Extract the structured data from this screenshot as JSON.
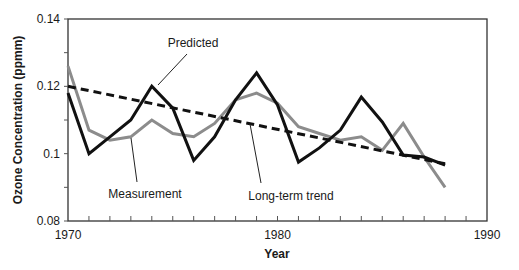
{
  "chart_data": {
    "type": "line",
    "title": "",
    "xlabel": "Year",
    "ylabel": "Ozone Concentration (ppmm)",
    "xlim": [
      1970,
      1990
    ],
    "ylim": [
      0.08,
      0.14
    ],
    "x_ticks": [
      1970,
      1980,
      1990
    ],
    "x_tick_labels": [
      "1970",
      "1980",
      "1990"
    ],
    "x_minor_step": 1,
    "y_ticks": [
      0.08,
      0.1,
      0.12,
      0.14
    ],
    "y_tick_labels": [
      "0.08",
      "0.1",
      "0.12",
      "0.14"
    ],
    "y_minor_step": 0.01,
    "grid": false,
    "legend": "none (inline annotations)",
    "x": [
      1970,
      1971,
      1972,
      1973,
      1974,
      1975,
      1976,
      1977,
      1978,
      1979,
      1980,
      1981,
      1982,
      1983,
      1984,
      1985,
      1986,
      1987,
      1988
    ],
    "series": [
      {
        "name": "Predicted",
        "color": "#111111",
        "style": "solid",
        "values": [
          0.118,
          0.1,
          0.105,
          0.11,
          0.12,
          0.1135,
          0.098,
          0.105,
          0.116,
          0.124,
          0.1145,
          0.0975,
          0.1017,
          0.107,
          0.1168,
          0.1094,
          0.0996,
          0.099,
          0.0966
        ]
      },
      {
        "name": "Measurement",
        "color": "#8c8c8c",
        "style": "solid",
        "values": [
          0.126,
          0.107,
          0.104,
          0.105,
          0.11,
          0.106,
          0.105,
          0.109,
          0.116,
          0.118,
          0.115,
          0.108,
          0.106,
          0.104,
          0.105,
          0.101,
          0.109,
          0.099,
          0.09
        ]
      },
      {
        "name": "Long-term trend",
        "color": "#111111",
        "style": "dashed",
        "x": [
          1970,
          1988
        ],
        "values": [
          0.12,
          0.097
        ]
      }
    ],
    "annotations": [
      {
        "text": "Predicted",
        "label_x": 193,
        "label_y": 47,
        "line": [
          187,
          54,
          158,
          85
        ]
      },
      {
        "text": "Measurement",
        "label_x": 145,
        "label_y": 198,
        "line": [
          131,
          138,
          137,
          182
        ]
      },
      {
        "text": "Long-term trend",
        "label_x": 291,
        "label_y": 200,
        "line": [
          250,
          124,
          261,
          183
        ]
      }
    ]
  }
}
